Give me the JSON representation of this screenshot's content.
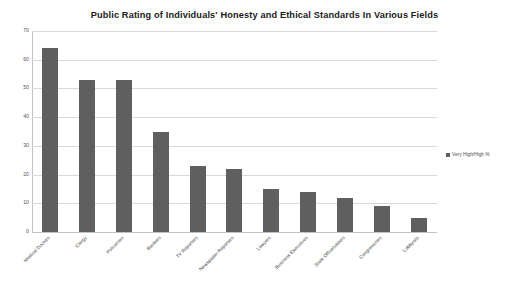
{
  "chart_data": {
    "type": "bar",
    "title": "Public Rating of Individuals' Honesty and Ethical Standards In Various Fields",
    "xlabel": "",
    "ylabel": "",
    "ylim": [
      0,
      70
    ],
    "ytick_step": 10,
    "yticks": [
      "0",
      "10",
      "20",
      "30",
      "40",
      "50",
      "60",
      "70"
    ],
    "grid": true,
    "legend_position": "right",
    "bar_color": "#5f5f5f",
    "categories": [
      "Medical Doctors",
      "Clergy",
      "Policemen",
      "Bankers",
      "TV Reporters",
      "Newspaper Reporters",
      "Lawyers",
      "Business Executives",
      "State Officeholders",
      "Congressmen",
      "Lobbyists"
    ],
    "series": [
      {
        "name": "Very High/High %",
        "values": [
          64,
          53,
          53,
          35,
          23,
          22,
          15,
          14,
          12,
          9,
          5
        ]
      }
    ]
  },
  "legend": {
    "marker": "square-marker",
    "label": "Very High/High %"
  }
}
